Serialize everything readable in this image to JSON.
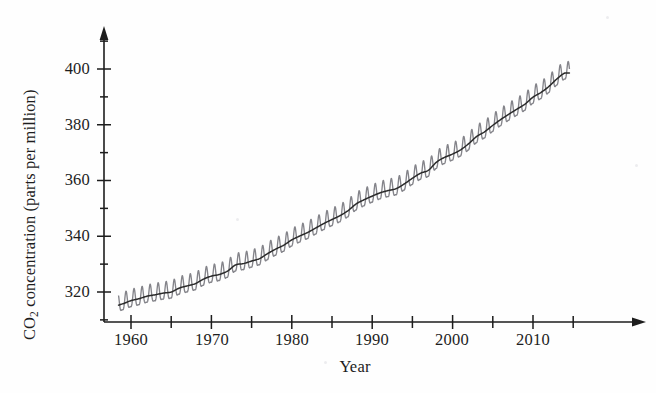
{
  "figure": {
    "background_color": "#fefefe",
    "ink_color": "#1d1d1d"
  },
  "axes": {
    "y_label_prefix": "CO",
    "y_label_sub": "2",
    "y_label_suffix": " concentration (parts per million)",
    "y_label_full": "CO2 concentration (parts per million)",
    "x_label": "Year",
    "y_major_ticks": [
      "320",
      "340",
      "360",
      "380",
      "400"
    ],
    "y_minor_ticks": [
      "310",
      "330",
      "350",
      "370",
      "390",
      "410"
    ],
    "x_major_ticks": [
      "1960",
      "1970",
      "1980",
      "1990",
      "2000",
      "2010"
    ],
    "x_minor_ticks": [
      "1955",
      "1965",
      "1975",
      "1985",
      "1995",
      "2005",
      "2015"
    ],
    "y_axis_has_arrow": true,
    "x_axis_has_arrow": true
  },
  "chart_data": {
    "type": "line",
    "title": "",
    "subtitle": "",
    "xlabel": "Year",
    "ylabel": "CO2 concentration (parts per million)",
    "xlim": [
      1954,
      2017
    ],
    "ylim": [
      308,
      412
    ],
    "grid": false,
    "legend_position": "none",
    "annotations": [],
    "series": [
      {
        "name": "Monthly mean CO2 concentration (Mauna Loa, seasonal cycle)",
        "color": "#808086",
        "style": "sawtooth-band",
        "seasonal_amplitude_ppm": 3.1,
        "description": "Monthly observations showing annual seasonal oscillation superimposed on rising trend"
      },
      {
        "name": "Smoothed annual trend",
        "color": "#2a2a2a",
        "style": "solid-line",
        "description": "Dark trend line through the centre of the oscillating monthly data"
      }
    ],
    "x": [
      1958,
      1959,
      1960,
      1961,
      1962,
      1963,
      1964,
      1965,
      1966,
      1967,
      1968,
      1969,
      1970,
      1971,
      1972,
      1973,
      1974,
      1975,
      1976,
      1977,
      1978,
      1979,
      1980,
      1981,
      1982,
      1983,
      1984,
      1985,
      1986,
      1987,
      1988,
      1989,
      1990,
      1991,
      1992,
      1993,
      1994,
      1995,
      1996,
      1997,
      1998,
      1999,
      2000,
      2001,
      2002,
      2003,
      2004,
      2005,
      2006,
      2007,
      2008,
      2009,
      2010,
      2011,
      2012,
      2013,
      2014
    ],
    "values": [
      315.0,
      315.8,
      316.9,
      317.6,
      318.5,
      319.0,
      319.6,
      320.0,
      321.4,
      322.2,
      323.0,
      324.6,
      325.7,
      326.3,
      327.5,
      329.7,
      330.2,
      331.1,
      332.0,
      333.8,
      335.4,
      336.8,
      338.7,
      340.1,
      341.4,
      343.0,
      344.6,
      346.0,
      347.4,
      349.2,
      351.6,
      353.1,
      354.4,
      355.6,
      356.4,
      357.1,
      358.8,
      360.8,
      362.6,
      363.7,
      366.6,
      368.3,
      369.5,
      371.0,
      373.2,
      375.8,
      377.5,
      379.8,
      381.9,
      383.8,
      385.6,
      387.4,
      389.9,
      391.6,
      393.8,
      396.5,
      398.6
    ]
  },
  "tick_positions": {
    "y": [
      {
        "label": "320",
        "y": 292
      },
      {
        "label": "340",
        "y": 236
      },
      {
        "label": "360",
        "y": 180
      },
      {
        "label": "380",
        "y": 125
      },
      {
        "label": "400",
        "y": 69
      }
    ],
    "x": [
      {
        "label": "1960",
        "x": 131
      },
      {
        "label": "1970",
        "x": 212
      },
      {
        "label": "1980",
        "x": 292
      },
      {
        "label": "1990",
        "x": 372
      },
      {
        "label": "2000",
        "x": 452
      },
      {
        "label": "2010",
        "x": 533
      }
    ]
  }
}
